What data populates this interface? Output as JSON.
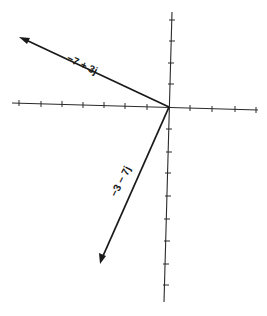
{
  "diagram": {
    "type": "complex-plane vector diagram",
    "axes": {
      "horizontal": {
        "ticks_left_of_origin": 7,
        "ticks_right_of_origin": 4
      },
      "vertical": {
        "ticks_above_origin": 4,
        "ticks_below_origin": 8
      }
    },
    "vectors": [
      {
        "label": "−7 + 3j",
        "real": -7,
        "imag": 3
      },
      {
        "label": "−3 − 7j",
        "real": -3,
        "imag": -7
      }
    ],
    "colors": {
      "ink": "#1a1a1a",
      "background": "#ffffff"
    }
  }
}
